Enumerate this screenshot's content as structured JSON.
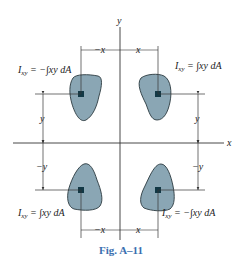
{
  "figure": {
    "caption": "Fig. A–11",
    "axes": {
      "x_label": "x",
      "y_label": "y"
    },
    "quadrants": [
      {
        "id": "second",
        "position": "top-left",
        "equation": "I_xy = −∫xy dA",
        "eq_main": "I",
        "eq_sub": "xy",
        "eq_rest": " = −∫xy dA",
        "x_dim": "−x",
        "y_dim": "y"
      },
      {
        "id": "first",
        "position": "top-right",
        "equation": "I_xy = ∫xy dA",
        "eq_main": "I",
        "eq_sub": "xy",
        "eq_rest": " = ∫xy dA",
        "x_dim": "x",
        "y_dim": "y"
      },
      {
        "id": "third",
        "position": "bottom-left",
        "equation": "I_xy = ∫xy dA",
        "eq_main": "I",
        "eq_sub": "xy",
        "eq_rest": " = ∫xy dA",
        "x_dim": "−x",
        "y_dim": "−y"
      },
      {
        "id": "fourth",
        "position": "bottom-right",
        "equation": "I_xy = −∫xy dA",
        "eq_main": "I",
        "eq_sub": "xy",
        "eq_rest": " = −∫xy dA",
        "x_dim": "x",
        "y_dim": "−y"
      }
    ],
    "colors": {
      "area_fill": "#8aa6b4",
      "area_stroke": "#2b3a40",
      "element_fill": "#123845",
      "line": "#333333",
      "caption": "#3b6fb0"
    }
  }
}
